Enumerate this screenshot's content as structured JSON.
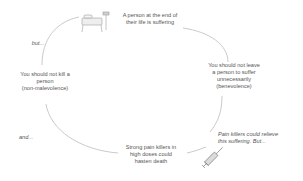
{
  "diagram": {
    "nodes": [
      {
        "id": "top",
        "lines": [
          "A person at the end of",
          "their life is suffering"
        ]
      },
      {
        "id": "right",
        "lines": [
          "You should not leave",
          "a person to suffer",
          "unnecessarily",
          "(benevolence)"
        ]
      },
      {
        "id": "bottom-right",
        "lines": [
          "Pain killers could relieve",
          "this suffering. But..."
        ]
      },
      {
        "id": "bottom",
        "lines": [
          "Strong pain killers in",
          "high doses could",
          "hasten death"
        ]
      },
      {
        "id": "left",
        "lines": [
          "You should not kill a",
          "person",
          "(non-malevolence)"
        ]
      }
    ],
    "connectors": [
      {
        "label": "but..."
      },
      {
        "label": "and..."
      }
    ],
    "icons": [
      "hospital-bed-icon",
      "syringe-icon"
    ],
    "colors": {
      "text": "#555555",
      "arrow": "#b0b0b0"
    }
  }
}
